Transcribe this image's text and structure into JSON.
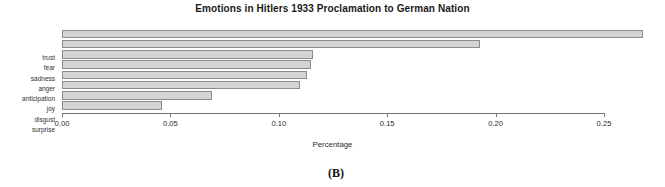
{
  "chart_data": {
    "type": "bar",
    "orientation": "horizontal",
    "title": "Emotions in Hitlers 1933 Proclamation to German Nation",
    "xlabel": "Percentage",
    "ylabel": "",
    "categories": [
      "trust",
      "fear",
      "sadness",
      "anger",
      "anticipation",
      "joy",
      "disgust",
      "surprise"
    ],
    "values": [
      0.268,
      0.193,
      0.116,
      0.115,
      0.113,
      0.11,
      0.069,
      0.046
    ],
    "xlim": [
      0.0,
      0.25
    ],
    "xticks": [
      0.0,
      0.05,
      0.1,
      0.15,
      0.2,
      0.25
    ],
    "xtick_labels": [
      "0.00",
      "0.05",
      "0.10",
      "0.15",
      "0.20",
      "0.25"
    ],
    "grid": false,
    "legend": false,
    "bar_color": "#d4d4d4",
    "bar_border_color": "#8c8c8c",
    "axis_color": "#767676"
  },
  "caption": {
    "label": "(B)"
  }
}
